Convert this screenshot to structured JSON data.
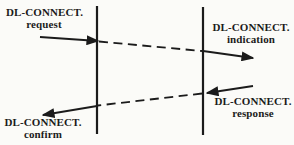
{
  "diagram": {
    "title_semantic": "DL-CONNECT service primitives sequence diagram",
    "ink_color": "#1b1b1b",
    "background_color": "#fbfbf8",
    "lifelines": {
      "left": "service-access-point-left",
      "right": "service-access-point-right"
    },
    "messages": {
      "request": {
        "line1": "DL-CONNECT.",
        "line2": "request"
      },
      "indication": {
        "line1": "DL-CONNECT.",
        "line2": "indication"
      },
      "response": {
        "line1": "DL-CONNECT.",
        "line2": "response"
      },
      "confirm": {
        "line1": "DL-CONNECT.",
        "line2": "confirm"
      }
    }
  }
}
